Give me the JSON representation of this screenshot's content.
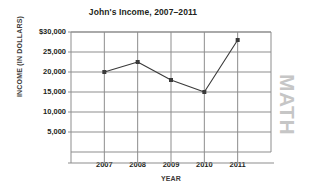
{
  "chart_data": {
    "type": "line",
    "title": "John's Income, 2007–2011",
    "xlabel": "YEAR",
    "ylabel": "INCOME (IN DOLLARS)",
    "categories": [
      "2007",
      "2008",
      "2009",
      "2010",
      "2011"
    ],
    "values": [
      20000,
      22500,
      18000,
      15000,
      28000
    ],
    "x_tick_labels": [
      "2007",
      "2008",
      "2009",
      "2010",
      "2011"
    ],
    "y_tick_labels": [
      "$30,000",
      "25,000",
      "20,000",
      "15,000",
      "10,000",
      "5,000"
    ],
    "y_tick_values": [
      30000,
      25000,
      20000,
      15000,
      10000,
      5000
    ],
    "ylim": [
      0,
      30000
    ],
    "xlim": [
      2006.5,
      2011.5
    ],
    "grid": true,
    "legend": "none",
    "marker": "square",
    "line_color": "#3a3a3a",
    "grid_color": "#8d8d8d",
    "axis_color": "#8d8d8d"
  },
  "watermark": {
    "text": "MATH",
    "color": "#c6c6c6"
  }
}
